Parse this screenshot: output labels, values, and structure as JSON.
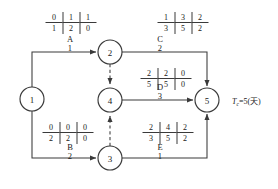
{
  "diagram": {
    "type": "activity-on-arrow-network",
    "stroke_color": "#3a3a3a",
    "nodes": [
      {
        "id": "n1",
        "label": "1",
        "cx": 32,
        "cy": 99,
        "r": 12
      },
      {
        "id": "n2",
        "label": "2",
        "cx": 110,
        "cy": 52,
        "r": 12
      },
      {
        "id": "n4",
        "label": "4",
        "cx": 110,
        "cy": 100,
        "r": 12
      },
      {
        "id": "n3",
        "label": "3",
        "cx": 110,
        "cy": 158,
        "r": 12
      },
      {
        "id": "n5",
        "label": "5",
        "cx": 207,
        "cy": 100,
        "r": 12
      }
    ],
    "edges": [
      {
        "id": "A",
        "from": "1",
        "to": "2",
        "letter": "A",
        "duration": "1",
        "style": "solid",
        "label_x": 70,
        "label_y": 44
      },
      {
        "id": "C",
        "from": "2",
        "to": "5",
        "letter": "C",
        "duration": "2",
        "style": "solid",
        "label_x": 160,
        "label_y": 44
      },
      {
        "id": "D",
        "from": "4",
        "to": "5",
        "letter": "D",
        "duration": "3",
        "style": "solid",
        "label_x": 160,
        "label_y": 92
      },
      {
        "id": "B",
        "from": "1",
        "to": "3",
        "letter": "B",
        "duration": "2",
        "style": "solid",
        "label_x": 70,
        "label_y": 152
      },
      {
        "id": "E",
        "from": "3",
        "to": "5",
        "letter": "E",
        "duration": "1",
        "style": "solid",
        "label_x": 160,
        "label_y": 152
      },
      {
        "id": "dummy-2-4",
        "from": "2",
        "to": "4",
        "letter": "",
        "duration": "",
        "style": "dashed",
        "label_x": 0,
        "label_y": 0
      },
      {
        "id": "dummy-3-4",
        "from": "3",
        "to": "4",
        "letter": "",
        "duration": "",
        "style": "dashed",
        "label_x": 0,
        "label_y": 0
      }
    ],
    "tables": [
      {
        "id": "table-A",
        "for_activity": "A",
        "x": 71,
        "y": 23,
        "top": [
          "0",
          "1",
          "1"
        ],
        "bottom": [
          "1",
          "2",
          "0"
        ]
      },
      {
        "id": "table-C",
        "for_activity": "C",
        "x": 183,
        "y": 23,
        "top": [
          "1",
          "3",
          "2"
        ],
        "bottom": [
          "3",
          "5",
          "2"
        ]
      },
      {
        "id": "table-D",
        "for_activity": "D",
        "x": 166,
        "y": 79,
        "top": [
          "2",
          "2",
          "0"
        ],
        "bottom": [
          "5",
          "5",
          "0"
        ]
      },
      {
        "id": "table-B",
        "for_activity": "B",
        "x": 68,
        "y": 133,
        "top": [
          "0",
          "0",
          "0"
        ],
        "bottom": [
          "2",
          "2",
          "0"
        ]
      },
      {
        "id": "table-E",
        "for_activity": "E",
        "x": 168,
        "y": 133,
        "top": [
          "2",
          "4",
          "2"
        ],
        "bottom": [
          "3",
          "5",
          "2"
        ]
      }
    ],
    "annotation": {
      "id": "project-duration",
      "symbol": "T",
      "subscript": "c",
      "text": "=5(天)",
      "full_text": "Tc=5(天)",
      "x": 232,
      "y": 100
    }
  }
}
